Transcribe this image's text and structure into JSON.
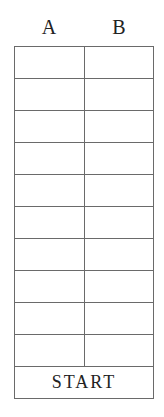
{
  "columns": [
    "A",
    "B"
  ],
  "rows": [
    [
      "",
      ""
    ],
    [
      "",
      ""
    ],
    [
      "",
      ""
    ],
    [
      "",
      ""
    ],
    [
      "",
      ""
    ],
    [
      "",
      ""
    ],
    [
      "",
      ""
    ],
    [
      "",
      ""
    ],
    [
      "",
      ""
    ],
    [
      "",
      ""
    ]
  ],
  "start_label": "START"
}
